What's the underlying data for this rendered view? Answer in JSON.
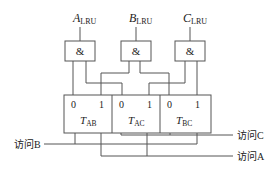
{
  "diagram": {
    "inputs": [
      {
        "main": "A",
        "sub": "LRU"
      },
      {
        "main": "B",
        "sub": "LRU"
      },
      {
        "main": "C",
        "sub": "LRU"
      }
    ],
    "gate_symbol": "&",
    "triggers": [
      {
        "zero": "0",
        "one": "1",
        "main": "T",
        "sub": "AB"
      },
      {
        "zero": "0",
        "one": "1",
        "main": "T",
        "sub": "AC"
      },
      {
        "zero": "0",
        "one": "1",
        "main": "T",
        "sub": "BC"
      }
    ],
    "access_labels": {
      "b": "访问B",
      "c": "访问C",
      "a": "访问A"
    },
    "colors": {
      "line": "#555555",
      "text": "#222222"
    }
  }
}
